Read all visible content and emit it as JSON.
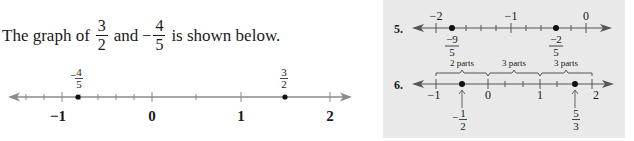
{
  "intro": {
    "prefix": "The graph of",
    "frac1": {
      "num": "3",
      "den": "2"
    },
    "conj": "and",
    "frac2": {
      "sign": "−",
      "num": "4",
      "den": "5"
    },
    "suffix": "is shown below."
  },
  "main_line": {
    "ticks": [
      "−1",
      "0",
      "1",
      "2"
    ],
    "point_a": {
      "sign": "−",
      "num": "4",
      "den": "5"
    },
    "point_b": {
      "num": "3",
      "den": "2"
    }
  },
  "panel": {
    "background": "#e9e9e9",
    "problem5": {
      "number": "5.",
      "ticks": [
        "−2",
        "−1",
        "0"
      ],
      "point_a": {
        "num": "−9",
        "den": "5"
      },
      "point_b": {
        "num": "−2",
        "den": "5"
      }
    },
    "problem6": {
      "number": "6.",
      "ticks": [
        "−1",
        "0",
        "1",
        "2"
      ],
      "braces": [
        "2 parts",
        "3 parts",
        "3 parts"
      ],
      "point_a": {
        "sign": "−",
        "num": "1",
        "den": "2"
      },
      "point_b": {
        "num": "5",
        "den": "3"
      }
    }
  },
  "colors": {
    "axis": "#8a8a8a",
    "point": "#111111",
    "text": "#1a1a1a"
  }
}
